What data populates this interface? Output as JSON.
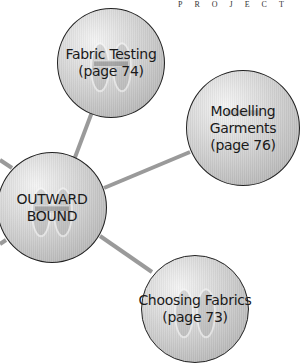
{
  "header": {
    "text": "PROJECT"
  },
  "colors": {
    "connector": "#9a9a9a",
    "outline": "#222222",
    "fill_light": "#f0f0f0",
    "fill_dark": "#a9a9a9",
    "text": "#1a1a1a"
  },
  "center_node": {
    "id": "outward-bound",
    "lines": [
      "OUTWARD",
      "BOUND"
    ]
  },
  "nodes": [
    {
      "id": "fabric-testing",
      "lines": [
        "Fabric Testing",
        "(page 74)"
      ]
    },
    {
      "id": "modelling-garments",
      "lines": [
        "Modelling",
        "Garments",
        "(page 76)"
      ]
    },
    {
      "id": "choosing-fabrics",
      "lines": [
        "Choosing Fabrics",
        "(page 73)"
      ]
    }
  ]
}
